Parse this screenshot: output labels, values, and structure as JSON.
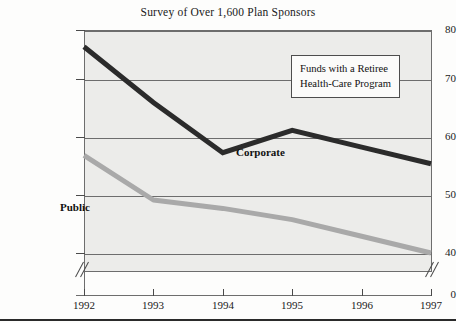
{
  "chart_data": {
    "type": "line",
    "title": "Survey of Over 1,600 Plan Sponsors",
    "xlabel": "",
    "ylabel": "",
    "categories": [
      "1992",
      "1993",
      "1994",
      "1995",
      "1996",
      "1997"
    ],
    "series": [
      {
        "name": "Corporate",
        "color": "#2b2b2b",
        "values": [
          77,
          67,
          58,
          62,
          59,
          56
        ]
      },
      {
        "name": "Public",
        "color": "#a9a9a9",
        "values": [
          57.5,
          49.5,
          48,
          46,
          43,
          40
        ]
      }
    ],
    "ylim": [
      38,
      80
    ],
    "yticks": [
      80,
      70,
      60,
      50,
      40
    ],
    "ytick_labels": [
      "80",
      "70",
      "60",
      "50",
      "40"
    ],
    "y_origin_label": "0",
    "xtick_labels": [
      "1992",
      "1993",
      "1994",
      "1995",
      "1996",
      "1997"
    ],
    "grid": true,
    "axis_break": true,
    "legend_position": "inside-top-right"
  },
  "legend": {
    "line1": "Funds with a Retiree",
    "line2": "Health-Care Program"
  },
  "series_labels": {
    "corporate": "Corporate",
    "public": "Public"
  },
  "colors": {
    "corporate_line": "#2b2b2b",
    "public_line": "#a9a9a9",
    "plot_background": "#ececea",
    "axis": "#6d6d6d",
    "text": "#1a1a1a"
  }
}
